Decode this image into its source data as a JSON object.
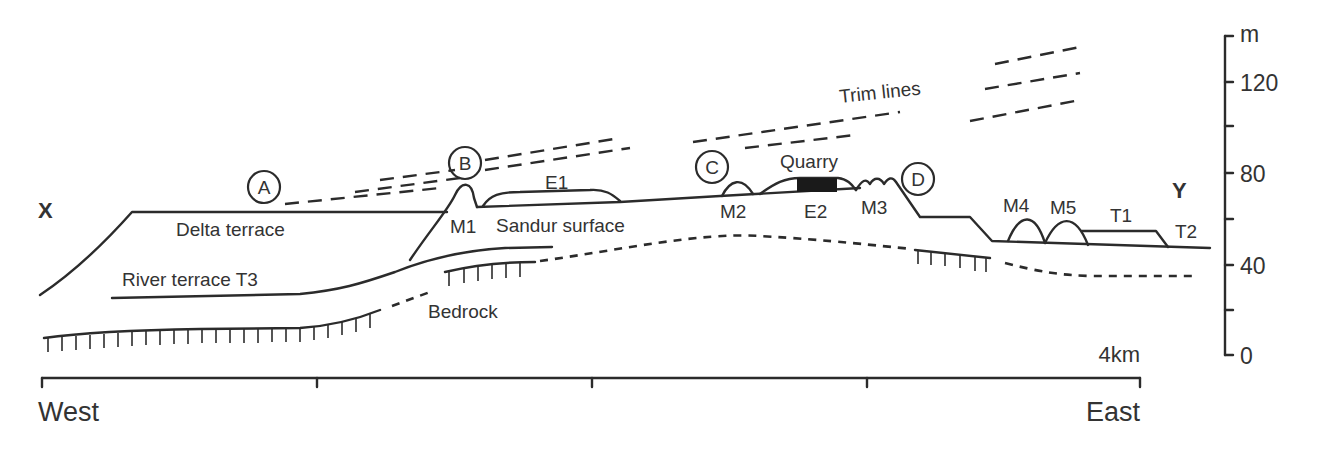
{
  "diagram": {
    "section_ends": {
      "left": "X",
      "right": "Y"
    },
    "site_markers": [
      "A",
      "B",
      "C",
      "D"
    ],
    "landform_labels": {
      "delta_terrace": "Delta terrace",
      "river_terrace": "River terrace T3",
      "sandur": "Sandur surface",
      "bedrock": "Bedrock",
      "trim_lines": "Trim lines",
      "quarry": "Quarry",
      "e1": "E1",
      "e2": "E2",
      "m1": "M1",
      "m2": "M2",
      "m3": "M3",
      "m4": "M4",
      "m5": "M5",
      "t1": "T1",
      "t2": "T2"
    },
    "vertical_scale": {
      "unit": "m",
      "ticks": [
        "120",
        "80",
        "40",
        "0"
      ]
    },
    "horizontal_scale": {
      "length_label": "4km",
      "west": "West",
      "east": "East"
    },
    "colors": {
      "ink": "#2b2b2b",
      "text": "#333333",
      "quarry_fill": "#1a1a1a"
    }
  }
}
